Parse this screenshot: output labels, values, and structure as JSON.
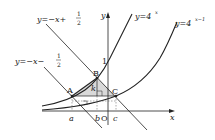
{
  "diagram": {
    "axes": {
      "x_label": "x",
      "y_label": "y",
      "origin_label": "O",
      "y_tick_label": "1"
    },
    "curves": [
      {
        "name": "y=4^x",
        "label_prefix": "y=4",
        "exponent": "x"
      },
      {
        "name": "y=4^(x-1)",
        "label_prefix": "y=4",
        "exponent": "x−1"
      }
    ],
    "lines": [
      {
        "name": "y=-x+1/2",
        "label_prefix": "y=−x+",
        "frac_num": "1",
        "frac_den": "2"
      },
      {
        "name": "y=-x-1/2",
        "label_prefix": "y=−x−",
        "frac_num": "1",
        "frac_den": "2"
      }
    ],
    "points": {
      "A": "A",
      "B": "B",
      "C": "C"
    },
    "x_ticks": {
      "a": "a",
      "b": "b",
      "c": "c"
    },
    "segment_label": "k",
    "colors": {
      "shade": "#d9d9d9",
      "stroke": "#222222",
      "dashed": "#555555"
    }
  }
}
